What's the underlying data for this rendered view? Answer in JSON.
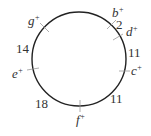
{
  "diagram": {
    "type": "circular-arrangement",
    "points": [
      {
        "id": "b",
        "label": "b",
        "sup": "+"
      },
      {
        "id": "d",
        "label": "d",
        "sup": "+"
      },
      {
        "id": "c",
        "label": "c",
        "sup": "+"
      },
      {
        "id": "f",
        "label": "f",
        "sup": "+"
      },
      {
        "id": "e",
        "label": "e",
        "sup": "+"
      },
      {
        "id": "g",
        "label": "g",
        "sup": "+"
      }
    ],
    "distances": [
      {
        "between": "b-d",
        "value": "2"
      },
      {
        "between": "d-c",
        "value": "11"
      },
      {
        "between": "c-f",
        "value": "11"
      },
      {
        "between": "f-e",
        "value": "18"
      },
      {
        "between": "e-g",
        "value": "14"
      }
    ]
  }
}
